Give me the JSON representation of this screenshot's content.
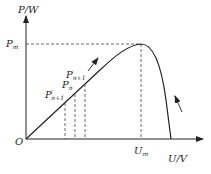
{
  "diagram": {
    "type": "pv-power-voltage-curve",
    "y_axis_label": "P/W",
    "x_axis_label": "U/V",
    "origin_label": "O",
    "max_power_label": "P",
    "max_power_sub": "m",
    "max_voltage_label": "U",
    "max_voltage_sub": "m",
    "points": [
      {
        "label": "P",
        "sub": "n+1",
        "prime": false
      },
      {
        "label": "P",
        "sub": "n",
        "prime": false
      },
      {
        "label": "P",
        "sub": "n+1",
        "prime": true
      }
    ],
    "colors": {
      "line": "#222222",
      "dash": "#444444"
    }
  }
}
